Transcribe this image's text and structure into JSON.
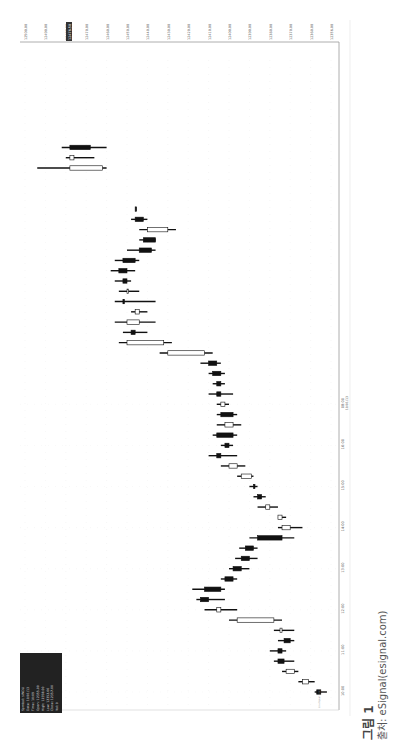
{
  "chart_data": {
    "type": "candlestick",
    "orientation": "rotated-90-clockwise",
    "title": "",
    "xlabel": "Time",
    "ylabel": "Price",
    "ylim": [
      12350,
      12500
    ],
    "price_ticks": [
      "12500.00",
      "12490.00",
      "12480.00",
      "12470.00",
      "12460.00",
      "12450.00",
      "12440.00",
      "12430.00",
      "12420.00",
      "12410.00",
      "12400.00",
      "12390.00",
      "12380.00",
      "12370.00",
      "12360.00",
      "12356.00"
    ],
    "last_price_marker": "12476.50",
    "time_ticks": [
      "10:00",
      "11:00",
      "12:00",
      "13:00",
      "14:00",
      "15:00",
      "16:00",
      "08:00"
    ],
    "date_label": "10/01/13",
    "grid": true,
    "candles": [
      {
        "t": 0.0,
        "o": 12355,
        "h": 12358,
        "l": 12352,
        "c": 12357,
        "bull": false
      },
      {
        "t": 0.25,
        "o": 12364,
        "h": 12366,
        "l": 12358,
        "c": 12361,
        "bull": true
      },
      {
        "t": 0.5,
        "o": 12372,
        "h": 12374,
        "l": 12366,
        "c": 12368,
        "bull": true
      },
      {
        "t": 0.75,
        "o": 12376,
        "h": 12378,
        "l": 12368,
        "c": 12373,
        "bull": false
      },
      {
        "t": 1.0,
        "o": 12376,
        "h": 12380,
        "l": 12372,
        "c": 12374,
        "bull": false
      },
      {
        "t": 1.25,
        "o": 12373,
        "h": 12376,
        "l": 12368,
        "c": 12370,
        "bull": false
      },
      {
        "t": 1.5,
        "o": 12375,
        "h": 12378,
        "l": 12368,
        "c": 12374,
        "bull": true
      },
      {
        "t": 1.75,
        "o": 12396,
        "h": 12400,
        "l": 12374,
        "c": 12378,
        "bull": true
      },
      {
        "t": 2.0,
        "o": 12406,
        "h": 12412,
        "l": 12396,
        "c": 12404,
        "bull": true
      },
      {
        "t": 2.25,
        "o": 12414,
        "h": 12416,
        "l": 12402,
        "c": 12410,
        "bull": false
      },
      {
        "t": 2.5,
        "o": 12412,
        "h": 12418,
        "l": 12402,
        "c": 12404,
        "bull": false
      },
      {
        "t": 2.75,
        "o": 12402,
        "h": 12404,
        "l": 12396,
        "c": 12398,
        "bull": false
      },
      {
        "t": 3.0,
        "o": 12398,
        "h": 12400,
        "l": 12390,
        "c": 12394,
        "bull": false
      },
      {
        "t": 3.25,
        "o": 12394,
        "h": 12397,
        "l": 12386,
        "c": 12390,
        "bull": false
      },
      {
        "t": 3.5,
        "o": 12392,
        "h": 12395,
        "l": 12386,
        "c": 12388,
        "bull": false
      },
      {
        "t": 3.75,
        "o": 12386,
        "h": 12390,
        "l": 12368,
        "c": 12374,
        "bull": false
      },
      {
        "t": 4.0,
        "o": 12374,
        "h": 12376,
        "l": 12364,
        "c": 12370,
        "bull": true
      },
      {
        "t": 4.25,
        "o": 12376,
        "h": 12376,
        "l": 12372,
        "c": 12374,
        "bull": true
      },
      {
        "t": 4.5,
        "o": 12382,
        "h": 12386,
        "l": 12376,
        "c": 12380,
        "bull": true
      },
      {
        "t": 4.75,
        "o": 12386,
        "h": 12388,
        "l": 12382,
        "c": 12384,
        "bull": false
      },
      {
        "t": 5.0,
        "o": 12388,
        "h": 12390,
        "l": 12386,
        "c": 12388,
        "bull": false
      },
      {
        "t": 5.25,
        "o": 12394,
        "h": 12396,
        "l": 12388,
        "c": 12389,
        "bull": true
      },
      {
        "t": 5.5,
        "o": 12400,
        "h": 12404,
        "l": 12392,
        "c": 12396,
        "bull": true
      },
      {
        "t": 5.75,
        "o": 12406,
        "h": 12410,
        "l": 12396,
        "c": 12404,
        "bull": false
      },
      {
        "t": 6.0,
        "o": 12402,
        "h": 12404,
        "l": 12398,
        "c": 12400,
        "bull": false
      },
      {
        "t": 6.25,
        "o": 12406,
        "h": 12408,
        "l": 12396,
        "c": 12398,
        "bull": false
      },
      {
        "t": 6.5,
        "o": 12402,
        "h": 12406,
        "l": 12394,
        "c": 12398,
        "bull": true
      },
      {
        "t": 6.75,
        "o": 12404,
        "h": 12406,
        "l": 12396,
        "c": 12398,
        "bull": false
      },
      {
        "t": 7.0,
        "o": 12404,
        "h": 12406,
        "l": 12400,
        "c": 12402,
        "bull": true
      },
      {
        "t": 7.25,
        "o": 12406,
        "h": 12410,
        "l": 12398,
        "c": 12404,
        "bull": false
      },
      {
        "t": 7.5,
        "o": 12406,
        "h": 12408,
        "l": 12402,
        "c": 12404,
        "bull": false
      },
      {
        "t": 7.75,
        "o": 12408,
        "h": 12410,
        "l": 12402,
        "c": 12404,
        "bull": false
      },
      {
        "t": 8.0,
        "o": 12410,
        "h": 12414,
        "l": 12404,
        "c": 12406,
        "bull": false
      },
      {
        "t": 8.25,
        "o": 12430,
        "h": 12434,
        "l": 12408,
        "c": 12412,
        "bull": true
      },
      {
        "t": 8.5,
        "o": 12450,
        "h": 12454,
        "l": 12428,
        "c": 12432,
        "bull": true
      },
      {
        "t": 8.75,
        "o": 12448,
        "h": 12452,
        "l": 12440,
        "c": 12446,
        "bull": false
      },
      {
        "t": 9.0,
        "o": 12450,
        "h": 12456,
        "l": 12436,
        "c": 12444,
        "bull": true
      },
      {
        "t": 9.25,
        "o": 12446,
        "h": 12448,
        "l": 12440,
        "c": 12444,
        "bull": true
      },
      {
        "t": 9.5,
        "o": 12452,
        "h": 12456,
        "l": 12436,
        "c": 12452,
        "bull": false
      },
      {
        "t": 9.75,
        "o": 12450,
        "h": 12454,
        "l": 12444,
        "c": 12450,
        "bull": true
      },
      {
        "t": 10.0,
        "o": 12452,
        "h": 12456,
        "l": 12448,
        "c": 12450,
        "bull": false
      },
      {
        "t": 10.25,
        "o": 12454,
        "h": 12458,
        "l": 12446,
        "c": 12450,
        "bull": false
      },
      {
        "t": 10.5,
        "o": 12452,
        "h": 12456,
        "l": 12444,
        "c": 12446,
        "bull": false
      },
      {
        "t": 10.75,
        "o": 12444,
        "h": 12450,
        "l": 12436,
        "c": 12438,
        "bull": false
      },
      {
        "t": 11.0,
        "o": 12442,
        "h": 12444,
        "l": 12436,
        "c": 12436,
        "bull": false
      },
      {
        "t": 11.25,
        "o": 12440,
        "h": 12444,
        "l": 12426,
        "c": 12430,
        "bull": true
      },
      {
        "t": 11.5,
        "o": 12446,
        "h": 12448,
        "l": 12440,
        "c": 12442,
        "bull": false
      },
      {
        "t": 11.75,
        "o": 12446,
        "h": 12446,
        "l": 12446,
        "c": 12446,
        "bull": false
      },
      {
        "t": 12.75,
        "o": 12478,
        "h": 12494,
        "l": 12460,
        "c": 12462,
        "bull": true
      },
      {
        "t": 13.0,
        "o": 12478,
        "h": 12480,
        "l": 12466,
        "c": 12476,
        "bull": true
      },
      {
        "t": 13.25,
        "o": 12478,
        "h": 12482,
        "l": 12460,
        "c": 12468,
        "bull": false
      }
    ]
  },
  "data_window": {
    "lines": [
      "Symbol: $INDU",
      "Date: 10/01/13",
      "Time: 10:09",
      "Open: 12355.00",
      "High: 12358.00",
      "Low: 12352.00",
      "Close: 12357.00",
      "Vol: 0"
    ]
  },
  "watermark": "(c) eSignal, 2013",
  "caption": {
    "figure": "그림 1",
    "source": "출처: eSignal(esignal.com)"
  }
}
